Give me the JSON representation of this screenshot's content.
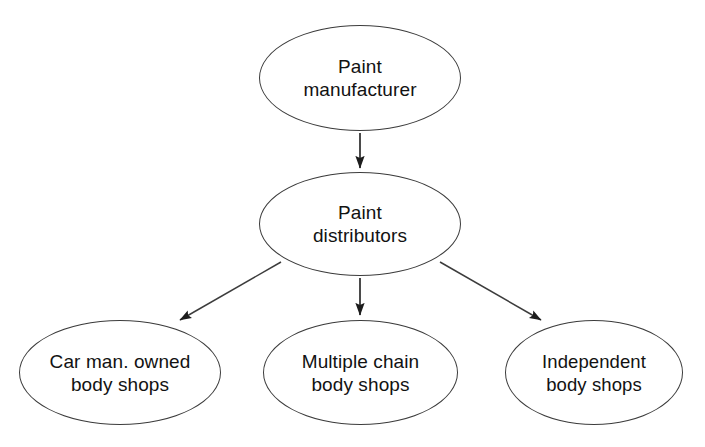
{
  "diagram": {
    "background_color": "#ffffff",
    "stroke_color": "#3c3c3c",
    "text_color": "#121212",
    "nodes": [
      {
        "id": "manufacturer",
        "label": "Paint\nmanufacturer",
        "shape": "ellipse",
        "level": 1
      },
      {
        "id": "distributors",
        "label": "Paint\ndistributors",
        "shape": "ellipse",
        "level": 2
      },
      {
        "id": "car-man-body-shops",
        "label": "Car man. owned\nbody shops",
        "shape": "ellipse",
        "level": 3
      },
      {
        "id": "multiple-chain-body-shops",
        "label": "Multiple chain\nbody shops",
        "shape": "ellipse",
        "level": 3
      },
      {
        "id": "independent-body-shops",
        "label": "Independent\nbody shops",
        "shape": "ellipse",
        "level": 3
      }
    ],
    "edges": [
      {
        "id": "edge-manufacturer-distributors",
        "from": "manufacturer",
        "to": "distributors",
        "style": "solid-arrow",
        "direction": "vertical"
      },
      {
        "id": "edge-distributors-car-man",
        "from": "distributors",
        "to": "car-man-body-shops",
        "style": "solid-arrow",
        "direction": "diagonal-left"
      },
      {
        "id": "edge-distributors-multi-chain",
        "from": "distributors",
        "to": "multiple-chain-body-shops",
        "style": "solid-arrow",
        "direction": "vertical"
      },
      {
        "id": "edge-distributors-independent",
        "from": "distributors",
        "to": "independent-body-shops",
        "style": "solid-arrow",
        "direction": "diagonal-right"
      }
    ]
  }
}
